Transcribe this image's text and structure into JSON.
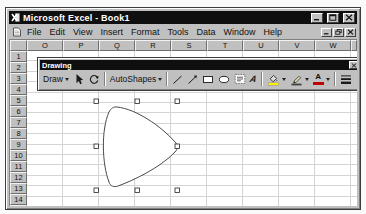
{
  "window": {
    "title": "Microsoft Excel - Book1",
    "title_bar_color": "#0f0f0f",
    "chrome_color": "#c0c0c0",
    "controls": [
      "minimize",
      "maximize",
      "close"
    ]
  },
  "menu_bar": {
    "items": [
      "File",
      "Edit",
      "View",
      "Insert",
      "Format",
      "Tools",
      "Data",
      "Window",
      "Help"
    ],
    "workbook_controls": [
      "minimize",
      "restore",
      "close"
    ]
  },
  "sheet": {
    "columns": [
      "O",
      "P",
      "Q",
      "R",
      "S",
      "T",
      "U",
      "V",
      "W"
    ],
    "rows": [
      "1",
      "2",
      "3",
      "4",
      "5",
      "6",
      "7",
      "8",
      "9",
      "10",
      "11",
      "12",
      "13",
      "14",
      "15"
    ],
    "grid_line_color": "#d4d4d4",
    "grid_bg_color": "#ffffff"
  },
  "drawing_toolbar": {
    "title": "Drawing",
    "draw_label": "Draw",
    "autoshapes_label": "AutoShapes",
    "font_color_letter": "A",
    "wordart_letter": "A",
    "buttons": [
      "draw-menu",
      "select-objects",
      "free-rotate",
      "autoshapes-menu",
      "line",
      "arrow",
      "rectangle",
      "oval",
      "text-box",
      "wordart",
      "fill-color",
      "line-color",
      "font-color",
      "line-style",
      "dash-style",
      "arrow-style",
      "shadow",
      "3d"
    ],
    "fill_color_swatch": "#ffef00",
    "line_color_swatch": "#404040",
    "font_color_swatch": "#c00000"
  },
  "shape": {
    "type": "freeform-rounded-triangle",
    "selected": true,
    "handle_count": 8,
    "fill": "#ffffff",
    "outline": "#4a4a4a"
  }
}
